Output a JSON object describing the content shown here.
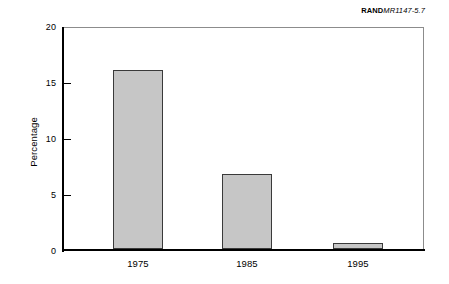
{
  "credit": {
    "brand": "RAND",
    "document_id": "MR1147-5.7"
  },
  "chart_data": {
    "type": "bar",
    "title": "",
    "xlabel": "",
    "ylabel": "Percentage",
    "categories": [
      "1975",
      "1985",
      "1995"
    ],
    "values": [
      16.0,
      6.7,
      0.5
    ],
    "ylim": [
      0,
      20
    ],
    "yticks": [
      0,
      5,
      10,
      15,
      20
    ],
    "ytick_labels": [
      "0",
      "5",
      "10",
      "15",
      "20"
    ],
    "grid": false,
    "legend": null,
    "bar_fill_color": "#c6c6c6",
    "bar_edge_color": "#3a3a3a",
    "axis_color": "#000000",
    "frame_color": "#8c8c8c"
  }
}
